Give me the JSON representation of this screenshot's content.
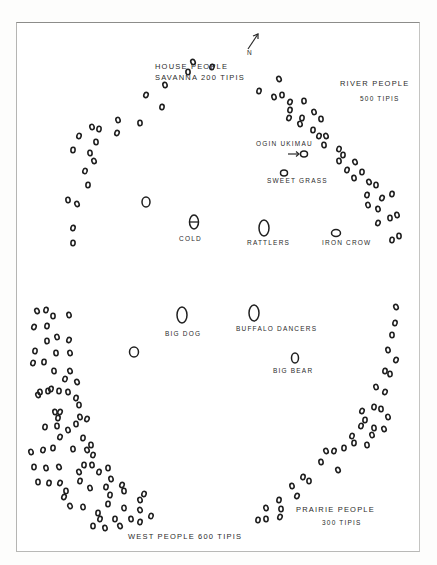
{
  "diagram": {
    "colors": {
      "ink": "#1f1f1f",
      "paper": "#ffffff",
      "frame": "#8c8c8a"
    },
    "north_arrow": {
      "label": "N",
      "icon": "north-arrow-icon"
    },
    "band_labels": {
      "house_people_line1": "HOUSE PEOPLE",
      "house_people_line2": "SAVANNA 200 TIPIS",
      "river_people_line1": "RIVER PEOPLE",
      "river_people_line2": "500 TIPIS",
      "prairie_people_line1": "PRAIRIE PEOPLE",
      "prairie_people_line2": "300 TIPIS",
      "west_people": "WEST PEOPLE 600 TIPIS"
    },
    "lodge_labels": {
      "ogin_ukimau": "OGIN UKIMAU",
      "sweet_grass": "SWEET GRASS",
      "cold": "COLD",
      "rattlers": "RATTLERS",
      "iron_crow": "IRON CROW",
      "big_dog": "BIG DOG",
      "buffalo_dancers": "BUFFALO DANCERS",
      "big_bear": "BIG BEAR"
    },
    "lodges": [
      {
        "name": "ogin-ukimau-lodge",
        "cx": 304,
        "cy": 154,
        "rx": 3.5,
        "ry": 3
      },
      {
        "name": "sweet-grass-lodge",
        "cx": 284,
        "cy": 173,
        "rx": 3.5,
        "ry": 3
      },
      {
        "name": "cold-lodge",
        "cx": 194,
        "cy": 222,
        "rx": 4.5,
        "ry": 7
      },
      {
        "name": "rattlers-lodge",
        "cx": 264,
        "cy": 228,
        "rx": 5,
        "ry": 8
      },
      {
        "name": "iron-crow-lodge",
        "cx": 336,
        "cy": 233,
        "rx": 4.5,
        "ry": 3.5
      },
      {
        "name": "lone-lodge-west",
        "cx": 146,
        "cy": 202,
        "rx": 4,
        "ry": 5
      },
      {
        "name": "big-dog-lodge",
        "cx": 182,
        "cy": 315,
        "rx": 5,
        "ry": 8
      },
      {
        "name": "buffalo-dancers-lodge",
        "cx": 254,
        "cy": 313,
        "rx": 5,
        "ry": 8
      },
      {
        "name": "big-bear-lodge",
        "cx": 295,
        "cy": 358,
        "rx": 3.5,
        "ry": 5
      },
      {
        "name": "lone-lodge-center",
        "cx": 134,
        "cy": 352,
        "rx": 4.5,
        "ry": 5
      }
    ],
    "tipis": {
      "house_people": [
        [
          193,
          62
        ],
        [
          212,
          67
        ],
        [
          188,
          72
        ],
        [
          165,
          85
        ],
        [
          146,
          95
        ],
        [
          162,
          107
        ],
        [
          140,
          123
        ],
        [
          118,
          120
        ],
        [
          117,
          133
        ],
        [
          99,
          129
        ],
        [
          96,
          142
        ],
        [
          92,
          127
        ],
        [
          79,
          136
        ],
        [
          73,
          150
        ],
        [
          90,
          153
        ],
        [
          94,
          161
        ],
        [
          85,
          171
        ],
        [
          88,
          185
        ],
        [
          68,
          200
        ],
        [
          77,
          204
        ],
        [
          73,
          228
        ],
        [
          73,
          243
        ]
      ],
      "river_people": [
        [
          279,
          79
        ],
        [
          259,
          91
        ],
        [
          282,
          95
        ],
        [
          274,
          97
        ],
        [
          290,
          102
        ],
        [
          290,
          110
        ],
        [
          304,
          101
        ],
        [
          314,
          112
        ],
        [
          289,
          118
        ],
        [
          302,
          118
        ],
        [
          321,
          119
        ],
        [
          300,
          124
        ],
        [
          319,
          136
        ],
        [
          313,
          130
        ],
        [
          324,
          145
        ],
        [
          326,
          136
        ],
        [
          339,
          149
        ],
        [
          343,
          155
        ],
        [
          339,
          161
        ],
        [
          355,
          162
        ],
        [
          347,
          170
        ],
        [
          362,
          172
        ],
        [
          354,
          178
        ],
        [
          369,
          182
        ],
        [
          367,
          195
        ],
        [
          376,
          185
        ],
        [
          378,
          209
        ],
        [
          382,
          198
        ],
        [
          392,
          194
        ],
        [
          390,
          218
        ],
        [
          397,
          215
        ],
        [
          378,
          223
        ],
        [
          392,
          240
        ],
        [
          399,
          236
        ],
        [
          368,
          205
        ]
      ],
      "west_people": [
        [
          37,
          311
        ],
        [
          46,
          310
        ],
        [
          53,
          316
        ],
        [
          69,
          315
        ],
        [
          34,
          327
        ],
        [
          47,
          326
        ],
        [
          47,
          341
        ],
        [
          57,
          337
        ],
        [
          69,
          340
        ],
        [
          35,
          351
        ],
        [
          56,
          353
        ],
        [
          70,
          353
        ],
        [
          33,
          363
        ],
        [
          44,
          362
        ],
        [
          54,
          371
        ],
        [
          70,
          371
        ],
        [
          65,
          379
        ],
        [
          48,
          391
        ],
        [
          40,
          392
        ],
        [
          38,
          395
        ],
        [
          51,
          389
        ],
        [
          59,
          391
        ],
        [
          68,
          392
        ],
        [
          77,
          382
        ],
        [
          76,
          398
        ],
        [
          79,
          405
        ],
        [
          55,
          412
        ],
        [
          60,
          412
        ],
        [
          58,
          418
        ],
        [
          76,
          424
        ],
        [
          80,
          417
        ],
        [
          87,
          419
        ],
        [
          45,
          427
        ],
        [
          57,
          426
        ],
        [
          68,
          430
        ],
        [
          60,
          437
        ],
        [
          83,
          438
        ],
        [
          91,
          445
        ],
        [
          31,
          452
        ],
        [
          43,
          450
        ],
        [
          53,
          448
        ],
        [
          73,
          449
        ],
        [
          87,
          450
        ],
        [
          93,
          455
        ],
        [
          84,
          465
        ],
        [
          92,
          465
        ],
        [
          79,
          472
        ],
        [
          99,
          472
        ],
        [
          34,
          467
        ],
        [
          46,
          468
        ],
        [
          59,
          467
        ],
        [
          80,
          481
        ],
        [
          108,
          468
        ],
        [
          111,
          479
        ],
        [
          122,
          485
        ],
        [
          106,
          487
        ],
        [
          66,
          491
        ],
        [
          90,
          488
        ],
        [
          60,
          483
        ],
        [
          110,
          495
        ],
        [
          124,
          491
        ],
        [
          140,
          500
        ],
        [
          144,
          494
        ],
        [
          108,
          504
        ],
        [
          124,
          508
        ],
        [
          140,
          510
        ],
        [
          151,
          516
        ],
        [
          98,
          513
        ],
        [
          83,
          507
        ],
        [
          70,
          506
        ],
        [
          100,
          519
        ],
        [
          115,
          519
        ],
        [
          131,
          519
        ],
        [
          120,
          526
        ],
        [
          140,
          522
        ],
        [
          93,
          526
        ],
        [
          105,
          528
        ],
        [
          64,
          497
        ],
        [
          49,
          483
        ],
        [
          38,
          482
        ]
      ],
      "prairie_people": [
        [
          396,
          307
        ],
        [
          395,
          323
        ],
        [
          392,
          335
        ],
        [
          388,
          350
        ],
        [
          396,
          360
        ],
        [
          385,
          371
        ],
        [
          390,
          374
        ],
        [
          376,
          387
        ],
        [
          385,
          392
        ],
        [
          374,
          407
        ],
        [
          381,
          409
        ],
        [
          388,
          417
        ],
        [
          361,
          426
        ],
        [
          365,
          420
        ],
        [
          374,
          428
        ],
        [
          384,
          429
        ],
        [
          352,
          436
        ],
        [
          354,
          443
        ],
        [
          367,
          445
        ],
        [
          326,
          451
        ],
        [
          334,
          451
        ],
        [
          344,
          448
        ],
        [
          321,
          462
        ],
        [
          338,
          470
        ],
        [
          303,
          477
        ],
        [
          309,
          481
        ],
        [
          292,
          486
        ],
        [
          297,
          496
        ],
        [
          279,
          500
        ],
        [
          281,
          509
        ],
        [
          266,
          508
        ],
        [
          280,
          517
        ],
        [
          258,
          520
        ],
        [
          266,
          519
        ],
        [
          372,
          435
        ],
        [
          362,
          411
        ]
      ]
    }
  }
}
